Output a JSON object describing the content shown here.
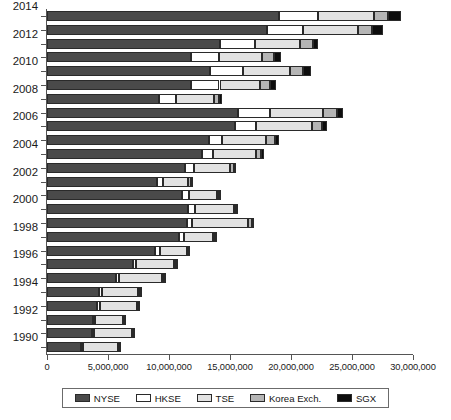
{
  "chart_data": {
    "type": "bar",
    "orientation": "horizontal",
    "stacked": true,
    "title": "",
    "xlabel": "",
    "ylabel": "",
    "xlim": [
      0,
      30000000
    ],
    "xticks": [
      0,
      5000000,
      10000000,
      15000000,
      20000000,
      25000000,
      30000000
    ],
    "xtick_labels": [
      "0",
      "5,000,000",
      "10,000,000",
      "15,000,000",
      "20,000,000",
      "25,000,000",
      "30,000,000"
    ],
    "grid": false,
    "legend_position": "bottom",
    "categories": [
      "2014",
      "2013",
      "2012",
      "2011",
      "2010",
      "2009",
      "2008",
      "2007",
      "2006",
      "2005",
      "2004",
      "2003",
      "2002",
      "2001",
      "2000",
      "1999",
      "1998",
      "1997",
      "1996",
      "1995",
      "1994",
      "1993",
      "1992",
      "1991",
      "1990"
    ],
    "visible_category_labels": [
      "2014",
      "2012",
      "2010",
      "2008",
      "2006",
      "2004",
      "2002",
      "2000",
      "1998",
      "1996",
      "1994",
      "1992",
      "1990"
    ],
    "series": [
      {
        "name": "NYSE",
        "color": "#4a4a4a",
        "values": [
          19020000,
          18040000,
          14200000,
          11800000,
          13390000,
          11840000,
          9210000,
          15650000,
          15420000,
          13310000,
          12710000,
          11330000,
          9010000,
          11030000,
          11530000,
          11440000,
          10860000,
          8850000,
          7010000,
          5650000,
          4250000,
          4080000,
          3790000,
          3710000,
          2820000
        ]
      },
      {
        "name": "HKSE",
        "color": "#ffffff",
        "values": [
          3230000,
          2950000,
          2830000,
          2260000,
          2710000,
          2300000,
          1330000,
          2650000,
          1710000,
          1060000,
          860000,
          710000,
          460000,
          620000,
          620000,
          480000,
          340000,
          410000,
          300000,
          230000,
          260000,
          270000,
          120000,
          110000,
          90000
        ]
      },
      {
        "name": "TSE",
        "color": "#e2e2e2",
        "values": [
          4520000,
          4510000,
          3680000,
          3540000,
          3830000,
          3310000,
          3110000,
          4330000,
          4610000,
          3600000,
          3560000,
          2950000,
          2090000,
          2260000,
          3160000,
          4550000,
          2440000,
          2220000,
          3090000,
          3550000,
          2940000,
          2990000,
          2320000,
          3130000,
          2900000
        ]
      },
      {
        "name": "Korea Exch.",
        "color": "#b5b5b5",
        "values": [
          1210000,
          1180000,
          1080000,
          1000000,
          1090000,
          840000,
          470000,
          1120000,
          830000,
          720000,
          430000,
          300000,
          220000,
          190000,
          170000,
          310000,
          110000,
          40000,
          140000,
          180000,
          190000,
          140000,
          100000,
          90000,
          80000
        ]
      },
      {
        "name": "SGX",
        "color": "#0d0d0d",
        "values": [
          1060000,
          880000,
          410000,
          560000,
          620000,
          480000,
          260000,
          540000,
          370000,
          310000,
          230000,
          180000,
          130000,
          130000,
          150000,
          200000,
          100000,
          110000,
          100000,
          110000,
          120000,
          110000,
          80000,
          70000,
          60000
        ]
      }
    ]
  },
  "legend": {
    "items": [
      {
        "label": "NYSE",
        "color": "#4a4a4a"
      },
      {
        "label": "HKSE",
        "color": "#ffffff"
      },
      {
        "label": "TSE",
        "color": "#e2e2e2"
      },
      {
        "label": "Korea Exch.",
        "color": "#b5b5b5"
      },
      {
        "label": "SGX",
        "color": "#0d0d0d"
      }
    ]
  }
}
